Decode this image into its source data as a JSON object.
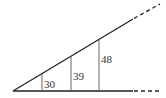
{
  "diagram": {
    "type": "similar-triangles-wedge",
    "colors": {
      "line": "#222222",
      "thin": "#555555",
      "text": "#333333"
    },
    "segments": [
      {
        "label": "30",
        "x": 42
      },
      {
        "label": "39",
        "x": 71
      },
      {
        "label": "48",
        "x": 99
      }
    ]
  }
}
